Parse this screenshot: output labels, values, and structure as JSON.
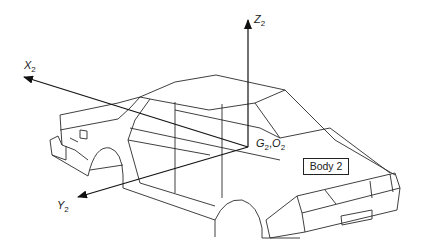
{
  "diagram": {
    "type": "coordinate-frame-on-vehicle",
    "axes": {
      "x": {
        "label": "X",
        "subscript": "2"
      },
      "y": {
        "label": "Y",
        "subscript": "2"
      },
      "z": {
        "label": "Z",
        "subscript": "2"
      }
    },
    "origin_label": {
      "g": "G",
      "g_sub": "2",
      "sep": ",",
      "o": "O",
      "o_sub": "2"
    },
    "body_label": "Body 2",
    "colors": {
      "line": "#2a2a2a",
      "background": "#ffffff"
    }
  }
}
